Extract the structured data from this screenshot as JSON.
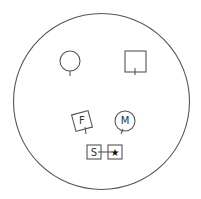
{
  "diagram": {
    "type": "genogram-circle",
    "stroke_color": "#555555",
    "outer_circle": {
      "cx": 101.5,
      "cy": 101.5,
      "r": 88
    },
    "symbols": [
      {
        "id": "circle-top-left",
        "shape": "circle",
        "label": "",
        "cx": 70,
        "cy": 61,
        "r": 10
      },
      {
        "id": "square-top-right",
        "shape": "square",
        "label": "",
        "x": 125,
        "y": 51,
        "size": 21
      },
      {
        "id": "square-f",
        "shape": "rotated-square",
        "label": "F",
        "cx": 82,
        "cy": 121,
        "size": 17,
        "rotation": -15
      },
      {
        "id": "circle-m",
        "shape": "circle",
        "label": "M",
        "cx": 125,
        "cy": 121,
        "r": 10
      },
      {
        "id": "square-s",
        "shape": "square",
        "label": "S",
        "x": 87,
        "y": 145,
        "size": 14
      },
      {
        "id": "square-star",
        "shape": "square",
        "label": "★",
        "x": 108,
        "y": 145,
        "size": 14
      }
    ]
  }
}
